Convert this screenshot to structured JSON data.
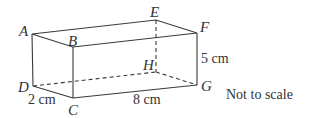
{
  "figure": {
    "type": "cuboid",
    "vertices": {
      "A": {
        "label": "A",
        "x": 32,
        "y": 34
      },
      "B": {
        "label": "B",
        "x": 73,
        "y": 47
      },
      "E": {
        "label": "E",
        "x": 156,
        "y": 20
      },
      "F": {
        "label": "F",
        "x": 197,
        "y": 33
      },
      "D": {
        "label": "D",
        "x": 33,
        "y": 86
      },
      "C": {
        "label": "C",
        "x": 73,
        "y": 98
      },
      "H": {
        "label": "H",
        "x": 156,
        "y": 72
      },
      "G": {
        "label": "G",
        "x": 197,
        "y": 85
      }
    },
    "dimensions": {
      "width": "2 cm",
      "length": "8 cm",
      "height": "5 cm"
    },
    "note": "Not to scale",
    "line_color": "#3a3a3a"
  }
}
